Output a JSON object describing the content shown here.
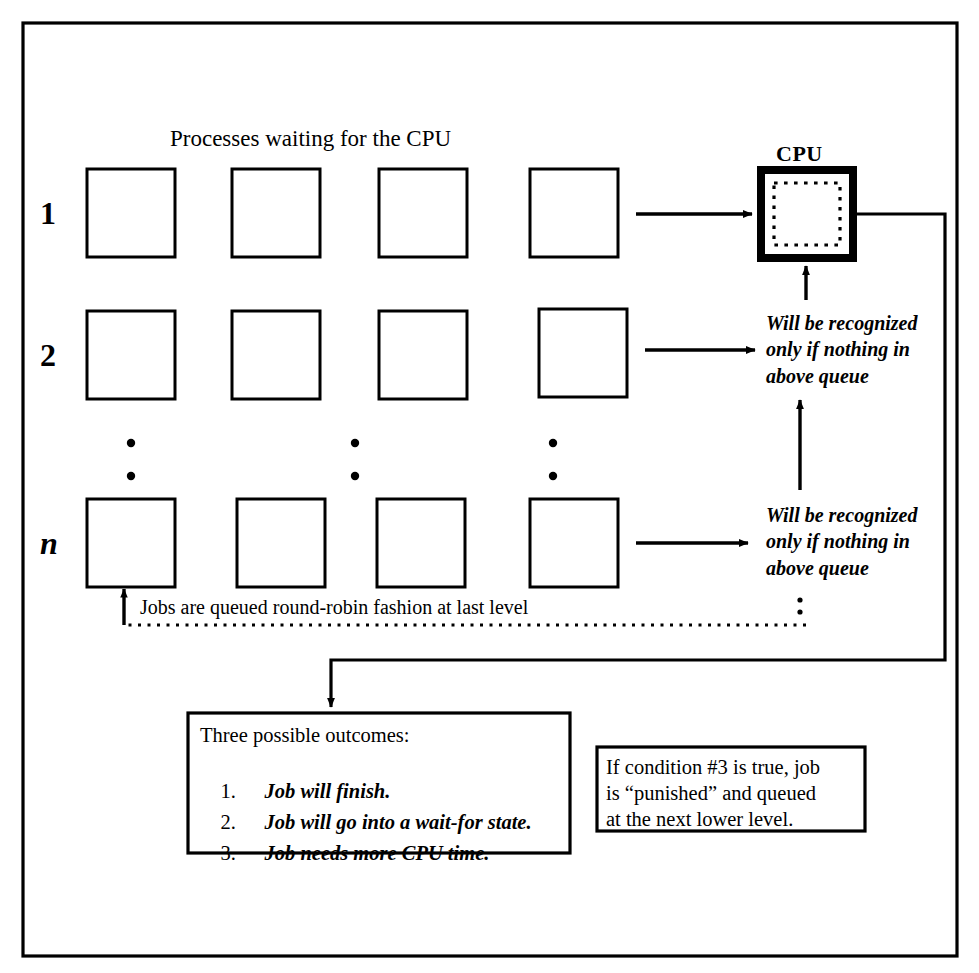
{
  "figure": {
    "kind": "multilevel-feedback-queue-scheduling-diagram",
    "title": "Processes waiting for the CPU",
    "cpu_label": "CPU",
    "colors": {
      "ink": "#000000",
      "paper": "#ffffff"
    },
    "rows": [
      {
        "label": "1",
        "italic": false,
        "boxes": 4
      },
      {
        "label": "2",
        "italic": false,
        "boxes": 4
      },
      {
        "label": "n",
        "italic": true,
        "boxes": 4
      }
    ],
    "ellipsis_columns": 3,
    "notes": {
      "queue_note_1": "Will be recognized\nonly if nothing in\nabove queue",
      "queue_note_2": "Will be recognized\nonly if nothing in\nabove queue",
      "round_robin": "Jobs are queued round-robin fashion at last level"
    },
    "outcomes_box": {
      "heading": "Three possible outcomes:",
      "items": [
        {
          "num": "1.",
          "text": "Job will finish."
        },
        {
          "num": "2.",
          "text": "Job will go into a wait-for state."
        },
        {
          "num": "3.",
          "text": "Job needs more CPU time."
        }
      ]
    },
    "punish_box": {
      "line1": "If condition #3 is true, job",
      "line2": "is “punished” and queued",
      "line3": "at the next lower level."
    }
  }
}
